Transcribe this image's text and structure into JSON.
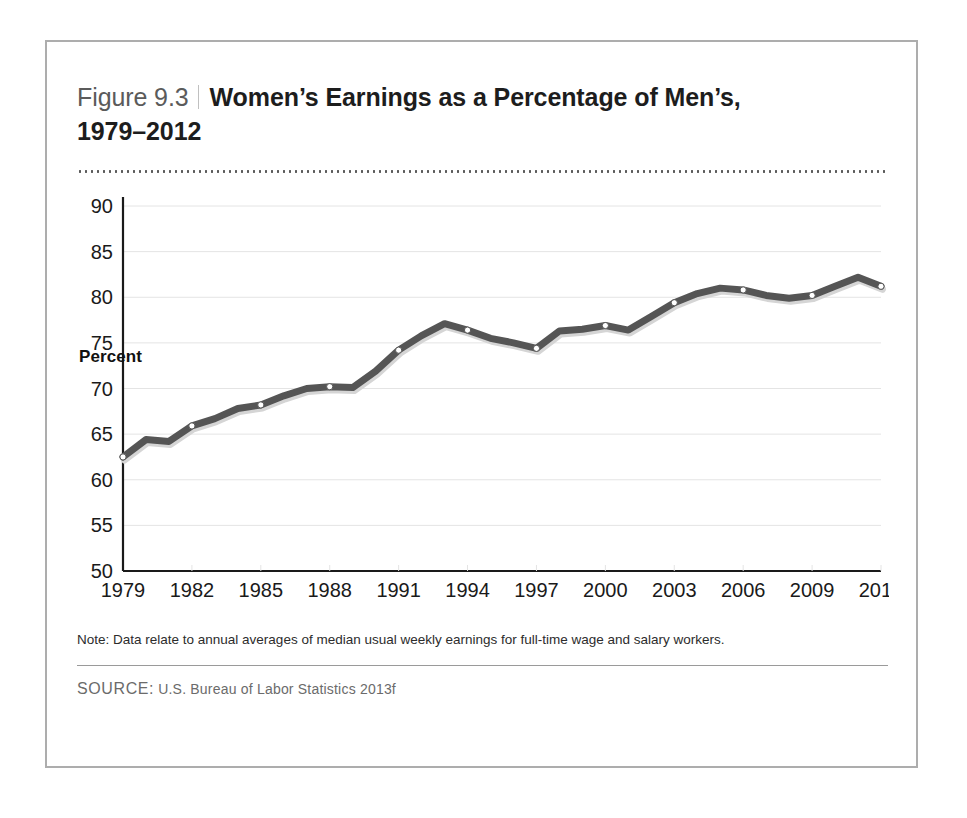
{
  "figure": {
    "number_label": "Figure 9.3",
    "title": "Women’s Earnings as a Percentage of Men’s, 1979–2012",
    "note": "Note: Data relate to annual averages of median usual weekly earnings for full-time wage and salary workers.",
    "source_label": "SOURCE:",
    "source_text": "U.S. Bureau of Labor Statistics 2013f"
  },
  "colors": {
    "line": "#555555",
    "marker_fill": "#ffffff",
    "marker_stroke": "#555555",
    "axis": "#1a1a1a",
    "grid": "#e4e4e4",
    "frame_border": "#adadad",
    "title_text": "#1d1d1d",
    "figure_number_text": "#5b5b5b",
    "source_text": "#6b6b6b"
  },
  "chart_data": {
    "type": "line",
    "title": "Women’s Earnings as a Percentage of Men’s, 1979–2012",
    "xlabel": "",
    "ylabel": "Percent",
    "ylim": [
      50,
      90
    ],
    "xlim": [
      1979,
      2012
    ],
    "ytick_step": 5,
    "yticks": [
      50,
      55,
      60,
      65,
      70,
      75,
      80,
      85,
      90
    ],
    "xticks": [
      1979,
      1982,
      1985,
      1988,
      1991,
      1994,
      1997,
      2000,
      2003,
      2006,
      2009,
      2012
    ],
    "grid": "horizontal",
    "legend": "none",
    "markers": "white circles at every data point",
    "x": [
      1979,
      1980,
      1981,
      1982,
      1983,
      1984,
      1985,
      1986,
      1987,
      1988,
      1989,
      1990,
      1991,
      1992,
      1993,
      1994,
      1995,
      1996,
      1997,
      1998,
      1999,
      2000,
      2001,
      2002,
      2003,
      2004,
      2005,
      2006,
      2007,
      2008,
      2009,
      2010,
      2011,
      2012
    ],
    "values": [
      62.5,
      64.4,
      64.2,
      65.9,
      66.7,
      67.8,
      68.2,
      69.2,
      70.0,
      70.2,
      70.1,
      71.9,
      74.2,
      75.8,
      77.1,
      76.4,
      75.5,
      75.0,
      74.4,
      76.3,
      76.5,
      76.9,
      76.4,
      77.9,
      79.4,
      80.4,
      81.0,
      80.8,
      80.2,
      79.9,
      80.2,
      81.2,
      82.2,
      81.2
    ],
    "series": [
      {
        "name": "Women’s earnings as a percentage of men’s",
        "values": [
          62.5,
          64.4,
          64.2,
          65.9,
          66.7,
          67.8,
          68.2,
          69.2,
          70.0,
          70.2,
          70.1,
          71.9,
          74.2,
          75.8,
          77.1,
          76.4,
          75.5,
          75.0,
          74.4,
          76.3,
          76.5,
          76.9,
          76.4,
          77.9,
          79.4,
          80.4,
          81.0,
          80.8,
          80.2,
          79.9,
          80.2,
          81.2,
          82.2,
          81.2
        ]
      }
    ]
  }
}
